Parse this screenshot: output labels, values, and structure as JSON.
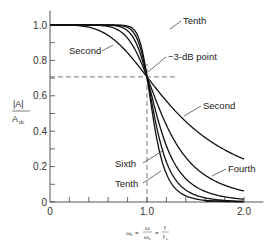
{
  "chart_data": {
    "type": "line",
    "title": "",
    "xlabel": "ωn = ω/ωc = f/fc",
    "ylabel": "|A| / Adc",
    "xlim": [
      0,
      2.2
    ],
    "ylim": [
      0,
      1.08
    ],
    "x_ticks": [
      {
        "value": 0,
        "label": "0"
      },
      {
        "value": 0.2,
        "label": ""
      },
      {
        "value": 0.4,
        "label": ""
      },
      {
        "value": 0.6,
        "label": ""
      },
      {
        "value": 0.8,
        "label": ""
      },
      {
        "value": 1.0,
        "label": "1.0"
      },
      {
        "value": 1.2,
        "label": ""
      },
      {
        "value": 1.4,
        "label": ""
      },
      {
        "value": 1.6,
        "label": ""
      },
      {
        "value": 1.8,
        "label": ""
      },
      {
        "value": 2.0,
        "label": "2.0"
      }
    ],
    "y_ticks": [
      {
        "value": 0,
        "label": "0"
      },
      {
        "value": 0.1,
        "label": ""
      },
      {
        "value": 0.2,
        "label": "0.2"
      },
      {
        "value": 0.3,
        "label": ""
      },
      {
        "value": 0.4,
        "label": "0.4"
      },
      {
        "value": 0.5,
        "label": ""
      },
      {
        "value": 0.6,
        "label": "0.6"
      },
      {
        "value": 0.7,
        "label": ""
      },
      {
        "value": 0.8,
        "label": "0.8"
      },
      {
        "value": 0.9,
        "label": ""
      },
      {
        "value": 1.0,
        "label": "1.0"
      }
    ],
    "grid": false,
    "reference_lines": {
      "x": 1.0,
      "y": 0.707,
      "style": "dashed"
    },
    "x": [
      0,
      0.2,
      0.4,
      0.6,
      0.8,
      0.9,
      1.0,
      1.1,
      1.2,
      1.4,
      1.6,
      1.8,
      2.0
    ],
    "series": [
      {
        "name": "Second",
        "order": 2,
        "values": [
          1,
          0.9992,
          0.987,
          0.941,
          0.842,
          0.777,
          0.707,
          0.637,
          0.57,
          0.454,
          0.364,
          0.295,
          0.243
        ]
      },
      {
        "name": "Fourth",
        "order": 4,
        "values": [
          1,
          1,
          0.9987,
          0.992,
          0.9125,
          0.836,
          0.707,
          0.564,
          0.434,
          0.206,
          0.121,
          0.076,
          0.062
        ]
      },
      {
        "name": "Sixth",
        "order": 6,
        "values": [
          1,
          1,
          1,
          0.999,
          0.966,
          0.894,
          0.707,
          0.49,
          0.317,
          0.132,
          0.06,
          0.029,
          0.0156
        ]
      },
      {
        "name": "Eighth",
        "order": 8,
        "values": [
          1,
          1,
          1,
          1,
          0.991,
          0.937,
          0.707,
          0.424,
          0.229,
          0.068,
          0.023,
          0.009,
          0.004
        ]
      },
      {
        "name": "Tenth",
        "order": 10,
        "values": [
          1,
          1,
          1,
          1,
          0.994,
          0.961,
          0.707,
          0.362,
          0.155,
          0.035,
          0.009,
          0.003,
          0.001
        ]
      }
    ],
    "annotations": [
      {
        "text": "Tenth",
        "points_to": "top-tenth"
      },
      {
        "text": "Second",
        "points_to": "top-second"
      },
      {
        "text": "−3-dB point",
        "points_to": "crossing"
      },
      {
        "text": "Second",
        "points_to": "tail-second"
      },
      {
        "text": "Fourth",
        "points_to": "tail-fourth"
      },
      {
        "text": "Sixth",
        "points_to": "tail-sixth"
      },
      {
        "text": "Tenth",
        "points_to": "tail-tenth"
      }
    ]
  },
  "labels": {
    "ylabel_num": "|A|",
    "ylabel_den": "A",
    "ylabel_den_sub": "dc",
    "xlabel_lhs": "ω",
    "xlabel_lhs_sub": "n",
    "xlabel_eq": "=",
    "xlabel_frac1_num": "ω",
    "xlabel_frac1_den": "ω",
    "xlabel_frac1_den_sub": "c",
    "xlabel_frac2_num": "f",
    "xlabel_frac2_den": "f",
    "xlabel_frac2_den_sub": "c",
    "ann_top_tenth": "Tenth",
    "ann_top_second": "Second",
    "ann_3db": "−3-dB point",
    "ann_tail_second": "Second",
    "ann_tail_fourth": "Fourth",
    "ann_tail_sixth": "Sixth",
    "ann_tail_tenth": "Tenth"
  },
  "colors": {
    "curve": "#111111",
    "axis": "#444444",
    "dashed": "#555555"
  }
}
